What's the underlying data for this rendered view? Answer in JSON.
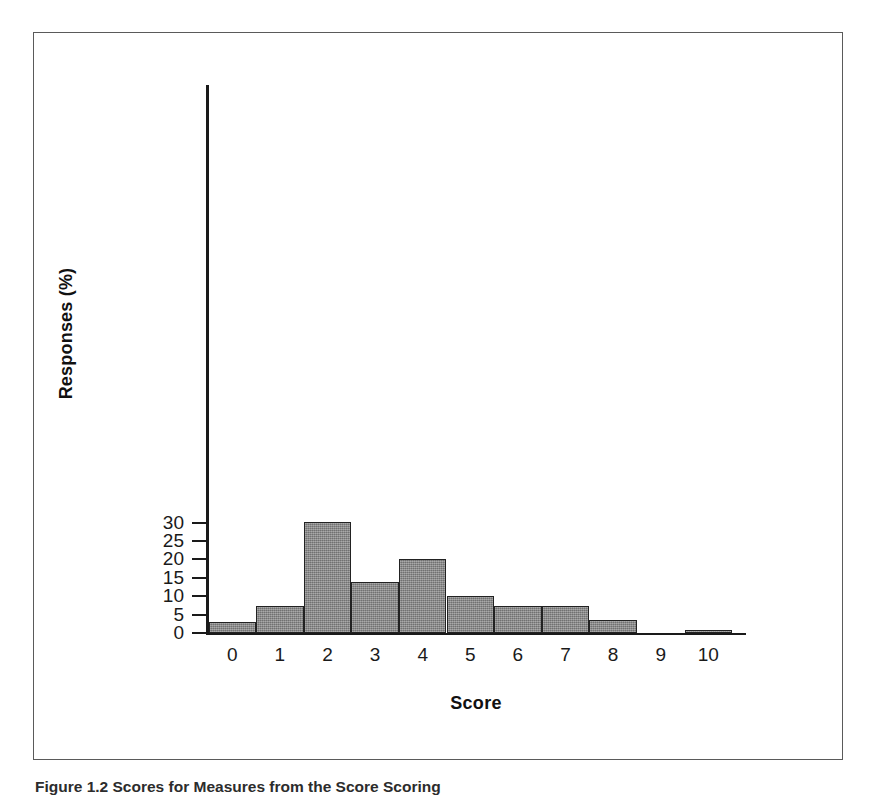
{
  "figure": {
    "caption": "Figure 1.2  Scores for Measures from the Score Scoring"
  },
  "chart_data": {
    "type": "bar",
    "title": "",
    "xlabel": "Score",
    "ylabel": "Responses (%)",
    "categories": [
      "0",
      "1",
      "2",
      "3",
      "4",
      "5",
      "6",
      "7",
      "8",
      "9",
      "10"
    ],
    "values": [
      3.1,
      7.3,
      30.2,
      13.8,
      20.1,
      9.95,
      7.3,
      7.3,
      3.55,
      0,
      0.3
    ],
    "ylim": [
      0,
      31
    ],
    "yticks": [
      0,
      5,
      10,
      15,
      20,
      25,
      30
    ],
    "ytick_labels": [
      "0",
      "5",
      "10",
      "15",
      "20",
      "25",
      "30"
    ],
    "xlim": [
      -0.5,
      10.5
    ],
    "grid": false,
    "legend": false,
    "bar_color": "#8a8a8a",
    "bar_edge_color": "#222222",
    "axis_color": "#1a1a1a",
    "background": "#ffffff"
  }
}
